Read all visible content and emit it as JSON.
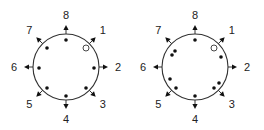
{
  "diagrams": [
    {
      "center": [
        66,
        67
      ],
      "radius": 33,
      "directions": [
        {
          "label": "1",
          "angle": 45
        },
        {
          "label": "2",
          "angle": 90
        },
        {
          "label": "3",
          "angle": 135
        },
        {
          "label": "4",
          "angle": 180
        },
        {
          "label": "5",
          "angle": 225
        },
        {
          "label": "6",
          "angle": 270
        },
        {
          "label": "7",
          "angle": 315
        },
        {
          "label": "8",
          "angle": 0
        }
      ],
      "filled_dots": [
        [
          66,
          40
        ],
        [
          94,
          68
        ],
        [
          86,
          88
        ],
        [
          66,
          96
        ],
        [
          47,
          88
        ],
        [
          39,
          68
        ],
        [
          47,
          48
        ]
      ],
      "open_dots": [
        [
          86,
          48
        ]
      ]
    },
    {
      "center": [
        195,
        67
      ],
      "radius": 33,
      "directions": [
        {
          "label": "1",
          "angle": 45
        },
        {
          "label": "2",
          "angle": 90
        },
        {
          "label": "3",
          "angle": 135
        },
        {
          "label": "4",
          "angle": 180
        },
        {
          "label": "5",
          "angle": 225
        },
        {
          "label": "6",
          "angle": 270
        },
        {
          "label": "7",
          "angle": 315
        },
        {
          "label": "8",
          "angle": 0
        }
      ],
      "filled_dots": [
        [
          195,
          40
        ],
        [
          221,
          57
        ],
        [
          219,
          83
        ],
        [
          214,
          88
        ],
        [
          195,
          96
        ],
        [
          170,
          79
        ],
        [
          176,
          88
        ],
        [
          175,
          51
        ],
        [
          172,
          55
        ]
      ],
      "open_dots": [
        [
          214,
          48
        ]
      ]
    }
  ],
  "colors": {
    "stroke": "#333333",
    "dot": "#111111",
    "background": "#ffffff"
  }
}
